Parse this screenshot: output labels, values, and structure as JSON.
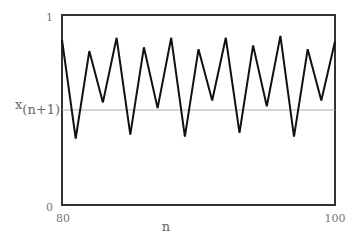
{
  "chart_data": {
    "type": "line",
    "title": "",
    "xlabel": "n",
    "ylabel": "x(n+1)",
    "ylabel_parts": {
      "base": "x",
      "subscript": "(n+1)"
    },
    "xlim": [
      80,
      100
    ],
    "ylim": [
      0,
      1
    ],
    "x_ticks": [
      "80",
      "100"
    ],
    "y_ticks": [
      "0",
      "1"
    ],
    "grid": false,
    "legend": null,
    "x": [
      80,
      81,
      82,
      83,
      84,
      85,
      86,
      87,
      88,
      89,
      90,
      91,
      92,
      93,
      94,
      95,
      96,
      97,
      98,
      99,
      100
    ],
    "series": [
      {
        "name": "x(n+1)",
        "color": "#111111",
        "values": [
          0.87,
          0.35,
          0.81,
          0.54,
          0.88,
          0.37,
          0.83,
          0.51,
          0.88,
          0.36,
          0.82,
          0.55,
          0.88,
          0.38,
          0.84,
          0.52,
          0.89,
          0.36,
          0.82,
          0.55,
          0.86
        ]
      }
    ],
    "reference_lines": [
      {
        "axis": "y",
        "value": 0.5,
        "color": "#aaaaaa"
      }
    ]
  },
  "colors": {
    "frame": "#333333",
    "line": "#111111",
    "reference": "#aaaaaa",
    "text": "#777777"
  }
}
